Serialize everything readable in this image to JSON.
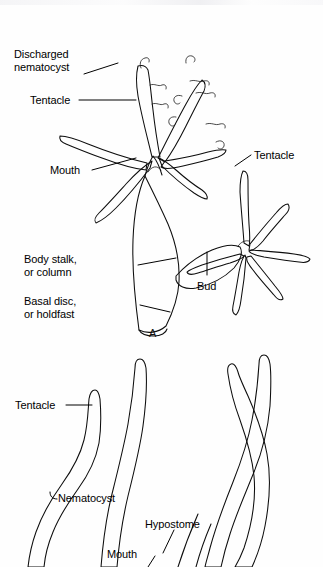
{
  "figure": {
    "panel_label": "A",
    "background_color": "#ffffff",
    "ink_color": "#0d0d0d",
    "panels": [
      {
        "id": "panel-a",
        "letter": "A",
        "subject": "Hydra polyp with attached bud"
      },
      {
        "id": "panel-b",
        "letter": "",
        "subject": "Tentacle detail with nematocysts and hypostome"
      }
    ],
    "labels": {
      "discharged_nematocyst_line1": "Discharged",
      "discharged_nematocyst_line2": "nematocyst",
      "tentacle_upper_left": "Tentacle",
      "mouth_upper": "Mouth",
      "tentacle_upper_right": "Tentacle",
      "body_stalk_line1": "Body stalk,",
      "body_stalk_line2": "or column",
      "basal_disc_line1": "Basal disc,",
      "basal_disc_line2": "or holdfast",
      "bud": "Bud",
      "panel_a_letter": "A",
      "tentacle_lower": "Tentacle",
      "nematocyst_lower": "Nematocyst",
      "hypostome_lower": "Hypostome",
      "mouth_lower": "Mouth"
    }
  }
}
